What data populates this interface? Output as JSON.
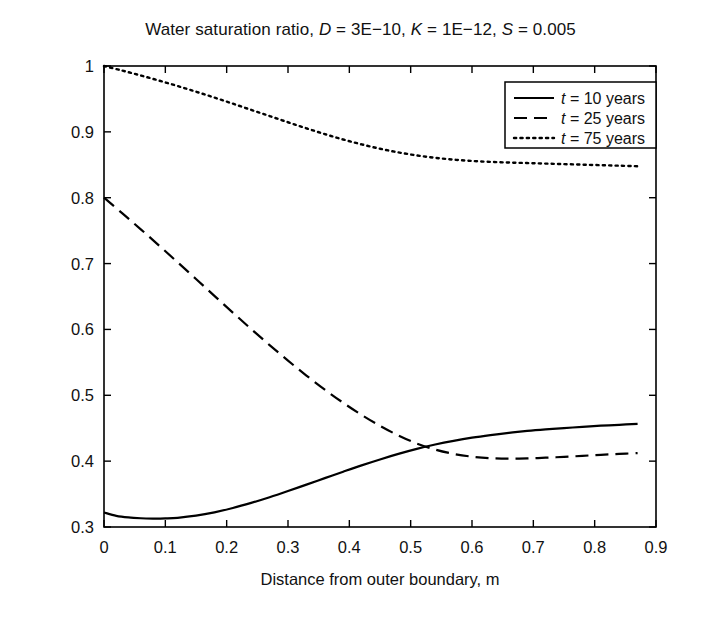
{
  "chart_data": {
    "type": "line",
    "title": "Water saturation ratio, D = 3E−10, K = 1E−12, S = 0.005",
    "title_parts": {
      "prefix": "Water saturation ratio, ",
      "sym_d": "D",
      "eq_d": " = 3E−10, ",
      "sym_k": "K",
      "eq_k": " = 1E−12, ",
      "sym_s": "S",
      "eq_s": " = 0.005"
    },
    "xlabel": "Distance from outer boundary, m",
    "ylabel": "Water saturation ratio, %",
    "xlim": [
      0,
      0.9
    ],
    "ylim": [
      0.3,
      1.0
    ],
    "grid": false,
    "xticks": [
      0,
      0.1,
      0.2,
      0.3,
      0.4,
      0.5,
      0.6,
      0.7,
      0.8,
      0.9
    ],
    "xticklabels": [
      "0",
      "0.1",
      "0.2",
      "0.3",
      "0.4",
      "0.5",
      "0.6",
      "0.7",
      "0.8",
      "0.9"
    ],
    "yticks": [
      0.3,
      0.4,
      0.5,
      0.6,
      0.7,
      0.8,
      0.9,
      1.0
    ],
    "yticklabels": [
      "0.3",
      "0.4",
      "0.5",
      "0.6",
      "0.7",
      "0.8",
      "0.9",
      "1"
    ],
    "legend_position": "upper right",
    "line_color": "#000000",
    "series": [
      {
        "name": "t = 10 years",
        "label_sym": "t",
        "label_rest": " = 10 years",
        "style": "solid",
        "x": [
          0.0,
          0.02,
          0.04,
          0.06,
          0.08,
          0.09,
          0.1,
          0.12,
          0.15,
          0.18,
          0.21,
          0.24,
          0.27,
          0.3,
          0.33,
          0.36,
          0.39,
          0.42,
          0.45,
          0.48,
          0.51,
          0.54,
          0.57,
          0.6,
          0.63,
          0.66,
          0.69,
          0.72,
          0.75,
          0.78,
          0.81,
          0.84,
          0.87
        ],
        "values": [
          0.322,
          0.317,
          0.3145,
          0.3133,
          0.3128,
          0.3128,
          0.313,
          0.314,
          0.3172,
          0.3222,
          0.3288,
          0.3366,
          0.3452,
          0.3546,
          0.3644,
          0.3742,
          0.384,
          0.3936,
          0.4026,
          0.411,
          0.4186,
          0.4252,
          0.4308,
          0.4356,
          0.4396,
          0.443,
          0.4459,
          0.4482,
          0.4501,
          0.4521,
          0.4538,
          0.4552,
          0.4565
        ]
      },
      {
        "name": "t = 25 years",
        "label_sym": "t",
        "label_rest": " = 25 years",
        "style": "dashed",
        "x": [
          0.0,
          0.03,
          0.06,
          0.09,
          0.12,
          0.15,
          0.18,
          0.21,
          0.24,
          0.27,
          0.3,
          0.33,
          0.36,
          0.39,
          0.42,
          0.45,
          0.48,
          0.51,
          0.54,
          0.57,
          0.6,
          0.63,
          0.66,
          0.69,
          0.72,
          0.75,
          0.78,
          0.81,
          0.84,
          0.87
        ],
        "values": [
          0.8,
          0.7762,
          0.752,
          0.7272,
          0.702,
          0.6766,
          0.651,
          0.6256,
          0.6006,
          0.5762,
          0.5526,
          0.53,
          0.5086,
          0.4886,
          0.4702,
          0.4536,
          0.439,
          0.4268,
          0.4176,
          0.411,
          0.4068,
          0.4045,
          0.4038,
          0.4042,
          0.4052,
          0.4065,
          0.408,
          0.4096,
          0.411,
          0.4122
        ]
      },
      {
        "name": "t = 75 years",
        "label_sym": "t",
        "label_rest": " = 75 years",
        "style": "dotted",
        "x": [
          0.0,
          0.03,
          0.06,
          0.09,
          0.12,
          0.15,
          0.18,
          0.21,
          0.24,
          0.27,
          0.3,
          0.33,
          0.36,
          0.39,
          0.42,
          0.45,
          0.48,
          0.51,
          0.54,
          0.57,
          0.6,
          0.63,
          0.66,
          0.69,
          0.72,
          0.75,
          0.78,
          0.81,
          0.84,
          0.87
        ],
        "values": [
          1.0,
          0.993,
          0.9856,
          0.9778,
          0.9696,
          0.961,
          0.952,
          0.9428,
          0.9334,
          0.924,
          0.9146,
          0.9054,
          0.8966,
          0.8884,
          0.881,
          0.8744,
          0.8688,
          0.8642,
          0.8606,
          0.8578,
          0.8558,
          0.8544,
          0.8534,
          0.8526,
          0.8518,
          0.851,
          0.8502,
          0.8494,
          0.8486,
          0.8478
        ]
      }
    ],
    "annotations": {
      "crossing": {
        "x": 0.64,
        "y": 0.435,
        "note": "t = 10 years crosses t = 25 years"
      },
      "solid_minimum": {
        "x": 0.09,
        "y": 0.313
      }
    }
  }
}
